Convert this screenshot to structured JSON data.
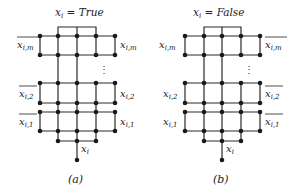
{
  "figure": {
    "panels": [
      {
        "id": "a",
        "title": "x_i = True",
        "title_parts": {
          "var": "x",
          "sub": "i",
          "eq": " = ",
          "value": "True"
        },
        "caption": "(a)",
        "left_labels": [
          {
            "var": "x",
            "sub": "i,m",
            "negated": true
          },
          {
            "var": "x",
            "sub": "i,2",
            "negated": true
          },
          {
            "var": "x",
            "sub": "i,1",
            "negated": true
          }
        ],
        "right_labels": [
          {
            "var": "x",
            "sub": "i,m",
            "negated": false
          },
          {
            "var": "x",
            "sub": "i,2",
            "negated": false
          },
          {
            "var": "x",
            "sub": "i,1",
            "negated": false
          }
        ],
        "bottom_label": {
          "var": "x",
          "sub": "i"
        },
        "ellipsis": "⋮"
      },
      {
        "id": "b",
        "title": "x_i = False",
        "title_parts": {
          "var": "x",
          "sub": "i",
          "eq": " = ",
          "value": "False"
        },
        "caption": "(b)",
        "left_labels": [
          {
            "var": "x",
            "sub": "i,m",
            "negated": false
          },
          {
            "var": "x",
            "sub": "i,2",
            "negated": false
          },
          {
            "var": "x",
            "sub": "i,1",
            "negated": false
          }
        ],
        "right_labels": [
          {
            "var": "x",
            "sub": "i,m",
            "negated": true
          },
          {
            "var": "x",
            "sub": "i,2",
            "negated": true
          },
          {
            "var": "x",
            "sub": "i,1",
            "negated": true
          }
        ],
        "bottom_label": {
          "var": "x",
          "sub": "i"
        },
        "ellipsis": "⋮"
      }
    ],
    "colors": {
      "edge": "#2a2a2a",
      "node": "#1a1a1a",
      "text": "#222222",
      "background": "#ffffff"
    }
  }
}
